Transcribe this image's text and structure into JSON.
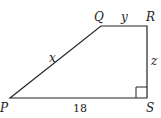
{
  "figure": {
    "shape": "trapezoid",
    "vertices": {
      "P": {
        "label": "P"
      },
      "Q": {
        "label": "Q"
      },
      "R": {
        "label": "R"
      },
      "S": {
        "label": "S"
      }
    },
    "sides": {
      "PQ": {
        "label": "x"
      },
      "QR": {
        "label": "y"
      },
      "RS": {
        "label": "z"
      },
      "PS": {
        "label": "18"
      }
    },
    "right_angle_at": "S",
    "colors": {
      "stroke": "#222222",
      "background": "#ffffff"
    }
  }
}
